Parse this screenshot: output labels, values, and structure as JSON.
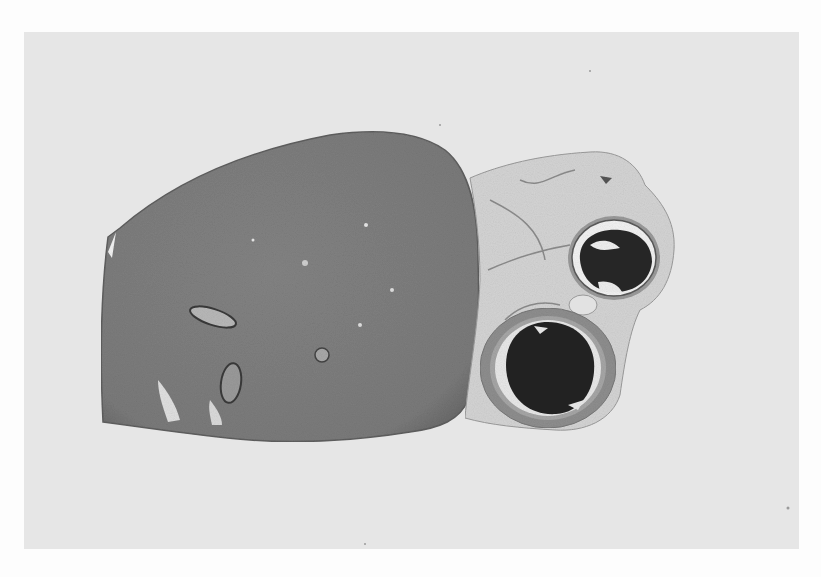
{
  "image": {
    "kind": "grayscale histology micrograph",
    "description": "Low-power tissue section: large homogeneous tissue lobe on the left, loose fibrous/fatty tissue on the right containing two round vessels with dark thrombus-filled lumens",
    "colors": {
      "page_background": "#fdfdfd",
      "slide_background": "#e6e6e6",
      "tissue_main": "#7e7e7e",
      "tissue_edge": "#6a6a6a",
      "loose_tissue": "#d6d6d6",
      "vessel_wall": "#a0a0a0",
      "lumen_dark": "#262626"
    }
  }
}
